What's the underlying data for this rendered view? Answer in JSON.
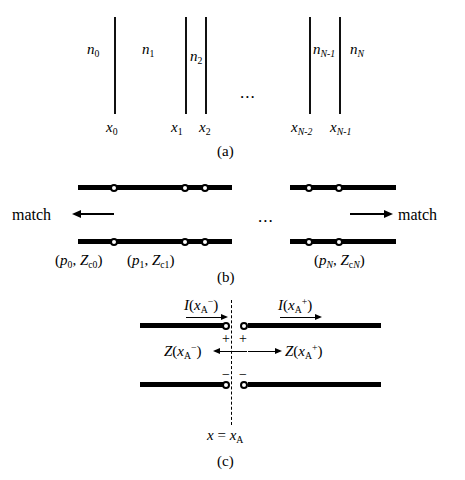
{
  "figure": {
    "background_color": "#ffffff",
    "ink_color": "#000000"
  },
  "panel_a": {
    "caption": "(a)",
    "ellipsis": "...",
    "refractive_index_labels": [
      {
        "base": "n",
        "sub": "0",
        "name": "n0"
      },
      {
        "base": "n",
        "sub": "1",
        "name": "n1"
      },
      {
        "base": "n",
        "sub": "2",
        "name": "n2"
      },
      {
        "base": "n",
        "sub": "N-1",
        "name": "nN-1"
      },
      {
        "base": "n",
        "sub": "N",
        "name": "nN"
      }
    ],
    "position_labels": [
      {
        "base": "x",
        "sub": "0",
        "name": "x0"
      },
      {
        "base": "x",
        "sub": "1",
        "name": "x1"
      },
      {
        "base": "x",
        "sub": "2",
        "name": "x2"
      },
      {
        "base": "x",
        "sub": "N-2",
        "name": "xN-2"
      },
      {
        "base": "x",
        "sub": "N-1",
        "name": "xN-1"
      }
    ],
    "interface_count": 5
  },
  "panel_b": {
    "caption": "(b)",
    "ellipsis": "...",
    "match_left_label": "match",
    "match_right_label": "match",
    "line_parameter_labels": [
      {
        "text": "(p0, Zc0)",
        "p_sub": "0",
        "z_sub": "c0",
        "name": "p0-zc0"
      },
      {
        "text": "(p1, Zc1)",
        "p_sub": "1",
        "z_sub": "c1",
        "name": "p1-zc1"
      },
      {
        "text": "(pN, ZcN)",
        "p_sub": "N",
        "z_sub": "cN",
        "name": "pN-zcN"
      }
    ]
  },
  "panel_c": {
    "caption": "(c)",
    "current_left": {
      "base": "I",
      "arg": "x",
      "arg_sub": "A",
      "arg_sup": "−",
      "name": "I(xA-)"
    },
    "current_right": {
      "base": "I",
      "arg": "x",
      "arg_sub": "A",
      "arg_sup": "+",
      "name": "I(xA+)"
    },
    "impedance_left": {
      "base": "Z",
      "arg": "x",
      "arg_sub": "A",
      "arg_sup": "−",
      "name": "Z(xA-)"
    },
    "impedance_right": {
      "base": "Z",
      "arg": "x",
      "arg_sub": "A",
      "arg_sup": "+",
      "name": "Z(xA+)"
    },
    "terminal_signs": {
      "plus": "+",
      "minus": "−"
    },
    "reference_plane": {
      "lhs": "x",
      "eq": "=",
      "rhs_base": "x",
      "rhs_sub": "A",
      "name": "x = xA"
    }
  }
}
